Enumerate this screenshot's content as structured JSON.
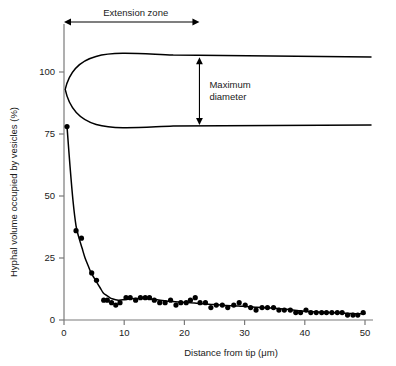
{
  "chart_data": {
    "type": "scatter",
    "title": "",
    "xlabel": "Distance from tip (μm)",
    "ylabel": "Hyphal volume occupied by vesicles (%)",
    "xlim": [
      0,
      51
    ],
    "ylim": [
      0,
      112
    ],
    "xticks": [
      0,
      10,
      20,
      30,
      40,
      50
    ],
    "yticks": [
      0,
      25,
      50,
      75,
      100
    ],
    "xtick_labels": [
      "0",
      "10",
      "20",
      "30",
      "40",
      "50"
    ],
    "ytick_labels": [
      "0",
      "25",
      "50",
      "75",
      "100"
    ],
    "grid": false,
    "legend": "none",
    "series": [
      {
        "name": "Hyphal volume occupied by vesicles",
        "marker": "filled-circle",
        "color": "#000000",
        "points": [
          [
            0.5,
            78
          ],
          [
            2.0,
            36
          ],
          [
            2.9,
            33
          ],
          [
            4.6,
            19
          ],
          [
            5.4,
            16
          ],
          [
            6.6,
            8
          ],
          [
            7.2,
            8
          ],
          [
            7.9,
            7
          ],
          [
            8.6,
            6
          ],
          [
            9.3,
            7
          ],
          [
            10.3,
            9
          ],
          [
            11.0,
            9
          ],
          [
            11.9,
            8
          ],
          [
            12.7,
            9
          ],
          [
            13.5,
            9
          ],
          [
            14.2,
            9
          ],
          [
            15.0,
            8
          ],
          [
            15.9,
            7
          ],
          [
            16.8,
            7
          ],
          [
            17.7,
            8
          ],
          [
            18.6,
            6
          ],
          [
            19.4,
            7
          ],
          [
            20.3,
            7
          ],
          [
            21.0,
            8
          ],
          [
            21.8,
            9
          ],
          [
            22.6,
            7
          ],
          [
            23.5,
            7
          ],
          [
            24.4,
            5
          ],
          [
            25.3,
            6
          ],
          [
            26.3,
            6
          ],
          [
            27.2,
            5
          ],
          [
            28.2,
            6
          ],
          [
            29.1,
            7
          ],
          [
            30.1,
            6
          ],
          [
            31.0,
            5
          ],
          [
            31.9,
            4
          ],
          [
            32.9,
            5
          ],
          [
            33.8,
            5
          ],
          [
            34.8,
            5
          ],
          [
            35.7,
            4
          ],
          [
            36.6,
            4
          ],
          [
            37.6,
            4
          ],
          [
            38.5,
            3
          ],
          [
            39.3,
            3
          ],
          [
            40.2,
            4
          ],
          [
            41.0,
            3
          ],
          [
            41.9,
            3
          ],
          [
            42.8,
            3
          ],
          [
            43.6,
            3
          ],
          [
            44.5,
            3
          ],
          [
            45.4,
            3
          ],
          [
            46.2,
            3
          ],
          [
            47.1,
            2
          ],
          [
            48.0,
            2
          ],
          [
            48.8,
            2
          ],
          [
            49.7,
            3
          ]
        ]
      }
    ],
    "fitted_curve": {
      "name": "fitted decay curve",
      "color": "#000000",
      "points": [
        [
          0.5,
          78
        ],
        [
          1.0,
          62
        ],
        [
          1.5,
          48
        ],
        [
          2.0,
          38
        ],
        [
          2.5,
          33
        ],
        [
          3.0,
          29
        ],
        [
          3.5,
          25
        ],
        [
          4.0,
          22
        ],
        [
          4.5,
          19
        ],
        [
          5.0,
          17
        ],
        [
          5.5,
          15
        ],
        [
          6.0,
          13
        ],
        [
          6.5,
          11
        ],
        [
          7.0,
          10
        ],
        [
          7.5,
          9.2
        ],
        [
          8.0,
          8.6
        ],
        [
          9.0,
          8.0
        ],
        [
          10.0,
          8.2
        ],
        [
          11.0,
          8.6
        ],
        [
          12.0,
          8.7
        ],
        [
          13.0,
          8.7
        ],
        [
          14.0,
          8.6
        ],
        [
          15.0,
          8.3
        ],
        [
          16.0,
          8.0
        ],
        [
          17.0,
          7.7
        ],
        [
          18.0,
          7.5
        ],
        [
          19.0,
          7.3
        ],
        [
          20.0,
          7.1
        ],
        [
          21.0,
          7.0
        ],
        [
          22.0,
          6.8
        ],
        [
          23.0,
          6.6
        ],
        [
          24.0,
          6.4
        ],
        [
          25.0,
          6.2
        ],
        [
          26.0,
          6.0
        ],
        [
          27.0,
          5.8
        ],
        [
          28.0,
          5.7
        ],
        [
          29.0,
          5.6
        ],
        [
          30.0,
          5.5
        ],
        [
          31.0,
          5.3
        ],
        [
          32.0,
          5.1
        ],
        [
          33.0,
          5.0
        ],
        [
          34.0,
          4.9
        ],
        [
          35.0,
          4.7
        ],
        [
          36.0,
          4.5
        ],
        [
          37.0,
          4.3
        ],
        [
          38.0,
          4.0
        ],
        [
          39.0,
          3.7
        ],
        [
          40.0,
          3.5
        ],
        [
          41.0,
          3.4
        ],
        [
          42.0,
          3.2
        ],
        [
          43.0,
          3.1
        ],
        [
          44.0,
          3.0
        ],
        [
          45.0,
          2.9
        ],
        [
          46.0,
          2.8
        ],
        [
          47.0,
          2.7
        ],
        [
          48.0,
          2.6
        ],
        [
          49.0,
          2.5
        ],
        [
          50.0,
          2.5
        ]
      ]
    },
    "annotations": [
      {
        "name": "extension-zone",
        "label": "Extension zone",
        "kind": "horizontal-double-arrow",
        "x_start": 0,
        "x_end": 22.5
      },
      {
        "name": "maximum-diameter",
        "label": "Maximum diameter",
        "label_lines": [
          "Maximum",
          "diameter"
        ],
        "kind": "vertical-double-arrow",
        "x": 22.5,
        "y_top": 107,
        "y_bottom": 78
      }
    ],
    "hypha_outline": {
      "name": "hypha-profile",
      "description": "tapering hyphal tip drawn above the plot",
      "color": "#000000",
      "tip_x": 0.2,
      "tip_y": 93,
      "upper_plateau_y": 107,
      "lower_plateau_y": 78,
      "x_end": 51
    }
  },
  "colors": {
    "ink": "#000000",
    "axis": "#7a7a7a",
    "text": "#1a1a1a"
  }
}
